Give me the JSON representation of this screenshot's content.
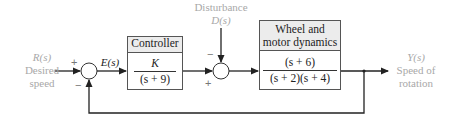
{
  "input": {
    "signal": "R(s)",
    "label_line1": "Desired",
    "label_line2": "speed"
  },
  "summing_junction_1": {
    "plus_sign": "+",
    "minus_sign": "−",
    "output_signal": "E(s)"
  },
  "controller": {
    "title": "Controller",
    "numerator": "K",
    "denominator": "(s + 9)"
  },
  "disturbance": {
    "label": "Disturbance",
    "signal": "D(s)"
  },
  "summing_junction_2": {
    "minus_sign": "−",
    "plus_sign": "+"
  },
  "plant": {
    "title_line1": "Wheel and",
    "title_line2": "motor dynamics",
    "numerator": "(s + 6)",
    "denominator": "(s + 2)(s + 4)"
  },
  "output": {
    "signal": "Y(s)",
    "label_line1": "Speed of",
    "label_line2": "rotation"
  },
  "colors": {
    "line": "#222222",
    "label_gray": "#a8a8a8",
    "box_header": "#ececec"
  }
}
